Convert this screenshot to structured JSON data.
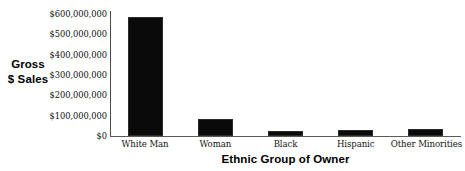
{
  "chart_data": {
    "type": "bar",
    "title": "",
    "subtitle": "",
    "xlabel": "Ethnic Group of Owner",
    "ylabel": "Gross $ Sales",
    "ylabel_lines": [
      "Gross",
      "$ Sales"
    ],
    "categories": [
      "White Man",
      "Woman",
      "Black",
      "Hispanic",
      "Other Minorities"
    ],
    "values": [
      585000000,
      85000000,
      27000000,
      30000000,
      33000000
    ],
    "ylim": [
      0,
      620000000
    ],
    "yticks": [
      0,
      100000000,
      200000000,
      300000000,
      400000000,
      500000000,
      600000000
    ],
    "ytick_labels": [
      "$600,000,000",
      "$500,000,000",
      "$400,000,000",
      "$300,000,000",
      "$200,000,000",
      "$100,000,000",
      "$0"
    ],
    "grid": false,
    "legend": false,
    "legend_position": "none",
    "bar_color": "#0a0a0a",
    "axis_color": "#5a5a5a",
    "background_color": "#ffffff"
  }
}
